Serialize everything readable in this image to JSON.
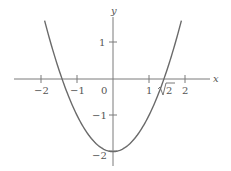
{
  "chart_data": {
    "type": "line",
    "title": "",
    "function": "y = x^2 - 2",
    "xlabel": "x",
    "ylabel": "y",
    "xlim": [
      -2.75,
      2.7
    ],
    "ylim": [
      -2.4,
      2.05
    ],
    "grid": false,
    "legend": null,
    "x_ticks": [
      {
        "value": -2,
        "label": "−2"
      },
      {
        "value": -1,
        "label": "−1"
      },
      {
        "value": 1,
        "label": "1"
      },
      {
        "value": 1.41421356,
        "label": "√2",
        "tick": false
      },
      {
        "value": 2,
        "label": "2"
      }
    ],
    "origin_label": "0",
    "y_ticks": [
      {
        "value": 1,
        "label": "1"
      },
      {
        "value": -1,
        "label": "−1"
      },
      {
        "value": -2,
        "label": "−2"
      }
    ],
    "series": [
      {
        "name": "x^2 - 2",
        "x": [
          -1.9,
          -1.75,
          -1.5,
          -1.4142,
          -1.25,
          -1.0,
          -0.75,
          -0.5,
          -0.25,
          0.0,
          0.25,
          0.5,
          0.75,
          1.0,
          1.25,
          1.4142,
          1.5,
          1.75,
          1.9
        ],
        "y": [
          1.61,
          1.0625,
          0.25,
          0.0,
          -0.4375,
          -1.0,
          -1.4375,
          -1.75,
          -1.9375,
          -2.0,
          -1.9375,
          -1.75,
          -1.4375,
          -1.0,
          -0.4375,
          0.0,
          0.25,
          1.0625,
          1.61
        ],
        "color": "#6a6a6a"
      }
    ],
    "roots": [
      -1.41421356,
      1.41421356
    ],
    "vertex": [
      0,
      -2
    ]
  },
  "colors": {
    "axis": "#7a7a7a",
    "curve": "#6a6a6a",
    "text": "#555555"
  }
}
